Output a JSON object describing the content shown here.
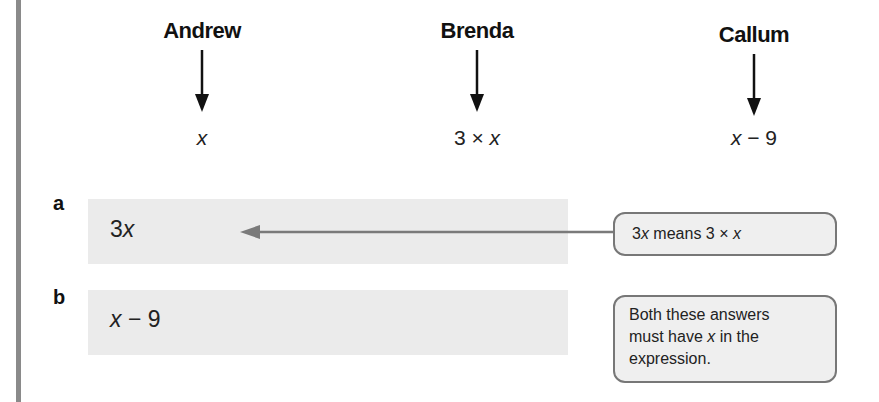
{
  "people": [
    {
      "name": "Andrew",
      "expression_parts": [
        "",
        "x",
        ""
      ]
    },
    {
      "name": "Brenda",
      "expression_parts": [
        "3 × ",
        "x",
        ""
      ]
    },
    {
      "name": "Callum",
      "expression_parts": [
        "",
        "x",
        " − 9"
      ]
    }
  ],
  "parts": [
    {
      "label": "a",
      "answer_prefix": "3",
      "answer_var": "x",
      "answer_suffix": ""
    },
    {
      "label": "b",
      "answer_prefix": "",
      "answer_var": "x",
      "answer_suffix": " − 9"
    }
  ],
  "notes": [
    {
      "pre": "3",
      "var1": "x",
      "mid": " means 3 × ",
      "var2": "x"
    },
    {
      "line1": "Both these answers",
      "line2_pre": "must have ",
      "line2_var": "x",
      "line2_post": " in the",
      "line3": "expression."
    }
  ],
  "colors": {
    "box_fill": "#ebebeb",
    "note_border": "#777777",
    "arrow_gray": "#7a7a7a",
    "left_rule": "#8a8a8a"
  }
}
